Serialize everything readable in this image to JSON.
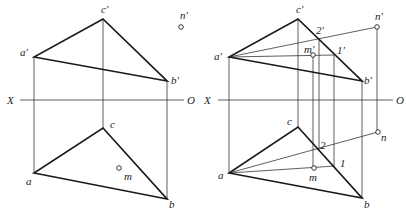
{
  "figure": {
    "left": {
      "axis": {
        "x_label": "X",
        "o_label": "O",
        "y": 100,
        "x1": 20,
        "x2": 184,
        "x_label_pos": [
          7,
          104
        ],
        "o_label_pos": [
          187,
          104
        ]
      },
      "elevation": {
        "a": {
          "label": "a'",
          "pos": [
            34,
            57
          ],
          "label_pos": [
            20,
            56
          ]
        },
        "b": {
          "label": "b'",
          "pos": [
            167,
            81
          ],
          "label_pos": [
            171,
            84
          ]
        },
        "c": {
          "label": "c'",
          "pos": [
            103,
            19
          ],
          "label_pos": [
            101,
            13
          ]
        },
        "points": [
          {
            "label": "n'",
            "pos": [
              181,
              27
            ],
            "label_pos": [
              180,
              19
            ]
          }
        ]
      },
      "plan": {
        "a": {
          "label": "a",
          "pos": [
            34,
            173
          ],
          "label_pos": [
            26,
            185
          ]
        },
        "b": {
          "label": "b",
          "pos": [
            167,
            199
          ],
          "label_pos": [
            169,
            208
          ]
        },
        "c": {
          "label": "c",
          "pos": [
            103,
            128
          ],
          "label_pos": [
            110,
            128
          ]
        },
        "points": [
          {
            "label": "m",
            "pos": [
              119,
              168
            ],
            "label_pos": [
              124,
              180
            ]
          }
        ]
      },
      "projectors": [
        {
          "from": [
            34,
            57
          ],
          "to": [
            34,
            173
          ]
        },
        {
          "from": [
            103,
            19
          ],
          "to": [
            103,
            128
          ]
        },
        {
          "from": [
            167,
            81
          ],
          "to": [
            167,
            199
          ]
        }
      ]
    },
    "right": {
      "axis": {
        "x_label": "X",
        "o_label": "O",
        "y": 100,
        "x1": 218,
        "x2": 393,
        "x_label_pos": [
          204,
          104
        ],
        "o_label_pos": [
          396,
          104
        ]
      },
      "elevation": {
        "a": {
          "label": "a'",
          "pos": [
            229,
            57
          ],
          "label_pos": [
            214,
            60
          ]
        },
        "b": {
          "label": "b'",
          "pos": [
            362,
            81
          ],
          "label_pos": [
            364,
            84
          ]
        },
        "c": {
          "label": "c'",
          "pos": [
            298,
            19
          ],
          "label_pos": [
            296,
            13
          ]
        },
        "points": [
          {
            "label": "n'",
            "pos": [
              377,
              27
            ],
            "label_pos": [
              375,
              20
            ],
            "circle": true
          },
          {
            "label": "m'",
            "pos": [
              313,
              55
            ],
            "label_pos": [
              304,
              53
            ],
            "circle": true
          },
          {
            "label": "2'",
            "pos": [
              319,
              38
            ],
            "label_pos": [
              316,
              34
            ],
            "circle": false
          },
          {
            "label": "1'",
            "pos": [
              334,
              55
            ],
            "label_pos": [
              337,
              54
            ],
            "circle": false
          }
        ]
      },
      "plan": {
        "a": {
          "label": "a",
          "pos": [
            229,
            173
          ],
          "label_pos": [
            218,
            179
          ]
        },
        "b": {
          "label": "b",
          "pos": [
            362,
            198
          ],
          "label_pos": [
            364,
            208
          ]
        },
        "c": {
          "label": "c",
          "pos": [
            298,
            127
          ],
          "label_pos": [
            287,
            125
          ]
        },
        "points": [
          {
            "label": "n",
            "pos": [
              378,
              132
            ],
            "label_pos": [
              381,
              141
            ],
            "circle": true
          },
          {
            "label": "m",
            "pos": [
              314,
              168
            ],
            "label_pos": [
              309,
              181
            ],
            "circle": true
          },
          {
            "label": "2",
            "pos": [
              318,
              150
            ],
            "label_pos": [
              320,
              149
            ],
            "circle": false
          },
          {
            "label": "1",
            "pos": [
              335,
              166
            ],
            "label_pos": [
              340,
              167
            ],
            "circle": false
          }
        ]
      },
      "aux_lines": {
        "elevation": [
          {
            "from": [
              229,
              57
            ],
            "to": [
              377,
              27
            ]
          },
          {
            "from": [
              229,
              57
            ],
            "to": [
              334,
              55
            ]
          }
        ],
        "plan": [
          {
            "from": [
              229,
              173
            ],
            "to": [
              378,
              132
            ]
          },
          {
            "from": [
              229,
              173
            ],
            "to": [
              335,
              166
            ]
          }
        ]
      },
      "projectors": [
        {
          "from": [
            229,
            57
          ],
          "to": [
            229,
            173
          ]
        },
        {
          "from": [
            298,
            19
          ],
          "to": [
            298,
            127
          ]
        },
        {
          "from": [
            362,
            81
          ],
          "to": [
            362,
            198
          ]
        },
        {
          "from": [
            377,
            27
          ],
          "to": [
            377,
            132
          ]
        },
        {
          "from": [
            313,
            55
          ],
          "to": [
            313,
            168
          ]
        },
        {
          "from": [
            319,
            38
          ],
          "to": [
            319,
            150
          ]
        },
        {
          "from": [
            334,
            55
          ],
          "to": [
            334,
            166
          ]
        }
      ]
    }
  }
}
